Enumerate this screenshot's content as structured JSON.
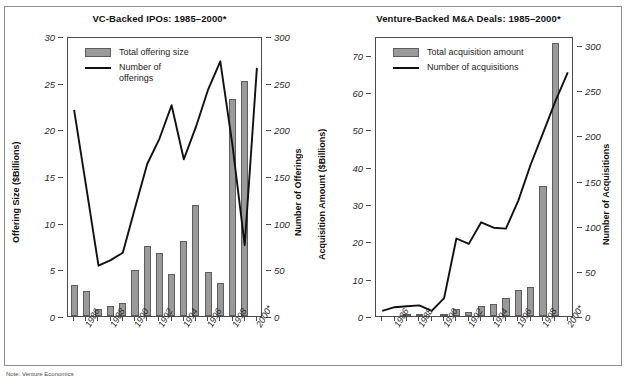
{
  "figure": {
    "note": "Note: Venture Economics",
    "bar_color": "#9a9a9a",
    "line_color": "#111111",
    "frame_color": "#8e8e8e"
  },
  "chart_data": [
    {
      "type": "bar",
      "id": "vc-backed-ipos",
      "title": "VC-Backed IPOs: 1985–2000*",
      "xlabel": "",
      "ylabel": "Offering Size ($Billions)",
      "y2label": "Number of Offerings",
      "ylim": [
        0,
        30
      ],
      "y2lim": [
        0,
        300
      ],
      "yticks": [
        0,
        5,
        10,
        15,
        20,
        25,
        30
      ],
      "y2ticks": [
        0,
        50,
        100,
        150,
        200,
        250,
        300
      ],
      "grid": false,
      "legend_position": "top-left",
      "categories": [
        "1985",
        "1986",
        "1987",
        "1988",
        "1989",
        "1990",
        "1991",
        "1992",
        "1993",
        "1994",
        "1995",
        "1996",
        "1997",
        "1998",
        "1999",
        "2000*"
      ],
      "tick_labels": [
        "",
        "1986",
        "",
        "1988",
        "",
        "1990",
        "",
        "1992",
        "",
        "1994",
        "",
        "1996",
        "",
        "1998",
        "",
        "2000*"
      ],
      "series": [
        {
          "name": "Total offering size",
          "kind": "bar",
          "axis": "left",
          "unit": "$Billions",
          "values": [
            3.3,
            2.7,
            0.8,
            1.1,
            1.4,
            4.9,
            7.5,
            6.8,
            4.5,
            8.0,
            11.9,
            4.7,
            3.5,
            23.2,
            25.2,
            0
          ]
        },
        {
          "name": "Number of offerings",
          "kind": "line",
          "axis": "right",
          "unit": "offerings",
          "values": [
            223,
            140,
            56,
            62,
            70,
            118,
            165,
            192,
            228,
            170,
            205,
            245,
            275,
            185,
            78,
            268
          ]
        }
      ]
    },
    {
      "type": "bar",
      "id": "venture-backed-ma-deals",
      "title": "Venture-Backed M&A Deals: 1985–2000*",
      "xlabel": "",
      "ylabel": "Acquisition Amount ($Billions)",
      "y2label": "Number of Acquisitions",
      "ylim": [
        0,
        75
      ],
      "y2lim": [
        0,
        310
      ],
      "yticks": [
        0,
        10,
        20,
        30,
        40,
        50,
        60,
        70
      ],
      "y2ticks": [
        0,
        50,
        100,
        150,
        200,
        250,
        300
      ],
      "grid": false,
      "legend_position": "top-left",
      "categories": [
        "1985",
        "1986",
        "1987",
        "1988",
        "1989",
        "1990",
        "1991",
        "1992",
        "1993",
        "1994",
        "1995",
        "1996",
        "1997",
        "1998",
        "1999",
        "2000*"
      ],
      "tick_labels": [
        "",
        "1986",
        "",
        "1988",
        "",
        "1990",
        "",
        "1992",
        "",
        "1994",
        "",
        "1996",
        "",
        "1998",
        "",
        "2000*"
      ],
      "series": [
        {
          "name": "Total acquisition amount",
          "kind": "bar",
          "axis": "left",
          "unit": "$Billions",
          "values": [
            0,
            0,
            0.3,
            0.2,
            0,
            0.4,
            1.9,
            1.2,
            2.6,
            3.1,
            4.9,
            7.1,
            7.7,
            34.7,
            73.0,
            0
          ]
        },
        {
          "name": "Number of acquisitions",
          "kind": "line",
          "axis": "right",
          "unit": "acquisitions",
          "values": [
            8,
            12,
            13,
            14,
            8,
            22,
            88,
            82,
            106,
            100,
            99,
            130,
            170,
            205,
            240,
            272
          ]
        }
      ]
    }
  ]
}
